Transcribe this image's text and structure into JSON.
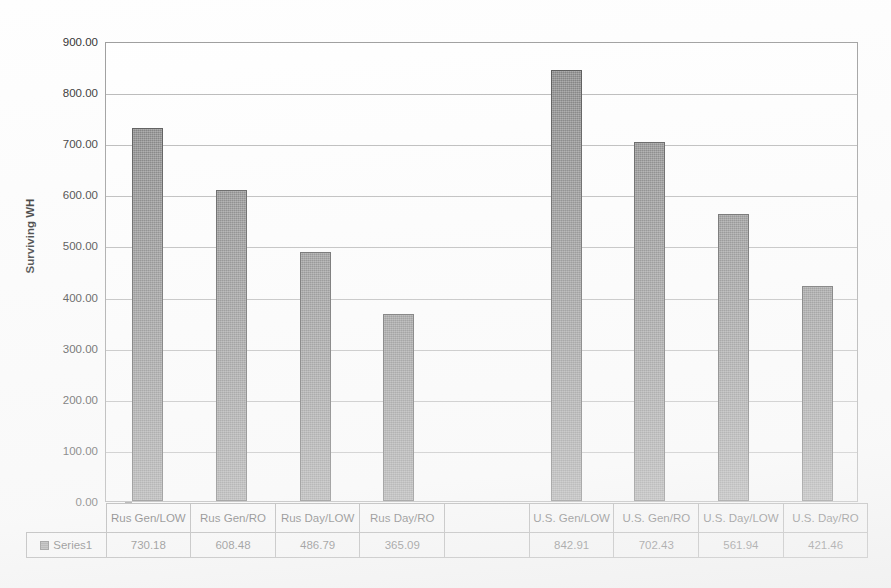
{
  "chart_data": {
    "type": "bar",
    "title": "",
    "xlabel": "",
    "ylabel": "Surviving WH",
    "ylim": [
      0,
      900
    ],
    "ytick_step": 100,
    "grid": true,
    "legend_position": "data-table-left",
    "series_name": "Series1",
    "categories": [
      "Rus Gen/LOW",
      "Rus Gen/RO",
      "Rus Day/LOW",
      "Rus Day/RO",
      "",
      "U.S. Gen/LOW",
      "U.S. Gen/RO",
      "U.S. Day/LOW",
      "U.S. Day/RO"
    ],
    "values": [
      730.18,
      608.48,
      486.79,
      365.09,
      null,
      842.91,
      702.43,
      561.94,
      421.46
    ],
    "value_labels": [
      "730.18",
      "608.48",
      "486.79",
      "365.09",
      "",
      "842.91",
      "702.43",
      "561.94",
      "421.46"
    ],
    "ytick_labels": [
      "900.00",
      "800.00",
      "700.00",
      "600.00",
      "500.00",
      "400.00",
      "300.00",
      "200.00",
      "100.00",
      "0.00"
    ],
    "ytick_values": [
      900,
      800,
      700,
      600,
      500,
      400,
      300,
      200,
      100,
      0
    ],
    "series": [
      {
        "name": "Series1",
        "values": [
          730.18,
          608.48,
          486.79,
          365.09,
          null,
          842.91,
          702.43,
          561.94,
          421.46
        ]
      }
    ],
    "colors": {
      "bar_fill": "#7e7e7e",
      "bar_border": "#4a4a4a",
      "gridline": "#b5b5b5",
      "axis": "#9a9a9a",
      "text": "#1f1f1f",
      "background": "#fefefe"
    }
  },
  "axis": {
    "y_title": "Surviving WH"
  },
  "legend": {
    "series_label": "Series1"
  },
  "ghost": {
    "title_text": ""
  }
}
